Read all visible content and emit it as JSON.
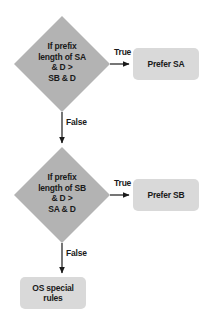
{
  "diagram": {
    "type": "flowchart",
    "background_color": "#ffffff",
    "decision_fill": "#b3b3b3",
    "terminal_fill": "#d9d9d9",
    "line_color": "#1a1a1a",
    "text_color": "#1a1a1a",
    "nodes": [
      {
        "id": "decision-prefix-sa",
        "shape": "diamond",
        "text": "If prefix\nlength of SA\n& D >\nSB & D"
      },
      {
        "id": "terminal-prefer-sa",
        "shape": "rounded-rect",
        "text": "Prefer SA"
      },
      {
        "id": "decision-prefix-sb",
        "shape": "diamond",
        "text": "If prefix\nlength of SB\n& D >\nSA & D"
      },
      {
        "id": "terminal-prefer-sb",
        "shape": "rounded-rect",
        "text": "Prefer SB"
      },
      {
        "id": "terminal-os-special-rules",
        "shape": "rounded-rect",
        "text": "OS special\nrules"
      }
    ],
    "edges": [
      {
        "id": "edge-sa-true",
        "from": "decision-prefix-sa",
        "to": "terminal-prefer-sa",
        "label": "True",
        "direction": "right"
      },
      {
        "id": "edge-sa-false",
        "from": "decision-prefix-sa",
        "to": "decision-prefix-sb",
        "label": "False",
        "direction": "down"
      },
      {
        "id": "edge-sb-true",
        "from": "decision-prefix-sb",
        "to": "terminal-prefer-sb",
        "label": "True",
        "direction": "right"
      },
      {
        "id": "edge-sb-false",
        "from": "decision-prefix-sb",
        "to": "terminal-os-special-rules",
        "label": "False",
        "direction": "down"
      }
    ]
  }
}
